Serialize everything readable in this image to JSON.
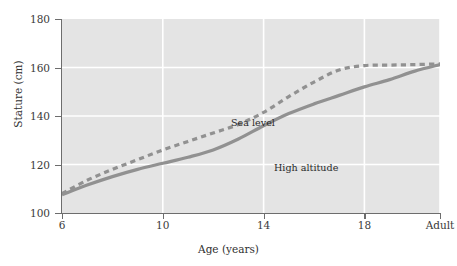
{
  "chart_data": {
    "type": "line",
    "title": "",
    "xlabel": "Age (years)",
    "ylabel": "Stature (cm)",
    "xlim": [
      6,
      21
    ],
    "ylim": [
      100,
      180
    ],
    "grid": true,
    "grid_color": "#ffffff",
    "plot_background": "#e4e4e4",
    "legend_position": "inline-annotations",
    "x_tick_labels": [
      "6",
      "10",
      "14",
      "18",
      "Adult"
    ],
    "x_tick_values": [
      6,
      10,
      14,
      18,
      21
    ],
    "y_tick_labels": [
      "100",
      "120",
      "140",
      "160",
      "180"
    ],
    "y_tick_values": [
      100,
      120,
      140,
      160,
      180
    ],
    "series": [
      {
        "name": "Sea level",
        "style": "dashed",
        "color": "#919191",
        "x": [
          6,
          7,
          8,
          9,
          10,
          11,
          12,
          13,
          14,
          15,
          16,
          17,
          18,
          19,
          20,
          21
        ],
        "values": [
          108,
          113.5,
          118,
          122,
          126,
          129.5,
          133,
          136.5,
          141.5,
          148,
          154,
          159,
          160.8,
          161,
          161.2,
          161.5
        ]
      },
      {
        "name": "High altitude",
        "style": "solid",
        "color": "#919191",
        "x": [
          6,
          7,
          8,
          9,
          10,
          11,
          12,
          13,
          14,
          15,
          16,
          17,
          18,
          19,
          20,
          21
        ],
        "values": [
          107.5,
          111.5,
          115,
          118,
          120.5,
          123,
          126,
          130.5,
          136,
          141,
          145,
          148.5,
          152,
          155,
          158.5,
          161.2
        ]
      }
    ],
    "annotations": [
      {
        "text": "Sea level",
        "x": 10.7,
        "y": 148
      },
      {
        "text": "High altitude",
        "x": 13.5,
        "y": 130
      }
    ]
  }
}
